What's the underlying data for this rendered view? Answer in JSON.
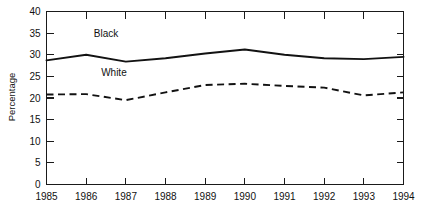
{
  "chart_data": {
    "type": "line",
    "title": "",
    "subtitle": "",
    "xlabel": "",
    "ylabel": "Percentage",
    "x": [
      1985,
      1986,
      1987,
      1988,
      1989,
      1990,
      1991,
      1992,
      1993,
      1994
    ],
    "xtick_labels": [
      "1985",
      "1986",
      "1987",
      "1988",
      "1989",
      "1990",
      "1991",
      "1992",
      "1993",
      "1994"
    ],
    "ytick_labels": [
      "0",
      "5",
      "10",
      "15",
      "20",
      "25",
      "30",
      "35",
      "40"
    ],
    "ytick_values": [
      0,
      5,
      10,
      15,
      20,
      25,
      30,
      35,
      40
    ],
    "xlim": [
      1985,
      1994
    ],
    "ylim": [
      0,
      40
    ],
    "grid": false,
    "legend_position": "inline-annotation",
    "series": [
      {
        "name": "Black",
        "style": "solid",
        "color": "#121212",
        "label_x": 1986.5,
        "label_y": 34.2,
        "values": [
          28.7,
          30.0,
          28.4,
          29.2,
          30.3,
          31.2,
          30.0,
          29.2,
          29.0,
          29.5
        ]
      },
      {
        "name": "White",
        "style": "dashed",
        "color": "#121212",
        "label_x": 1986.7,
        "label_y": 25.0,
        "values": [
          20.8,
          20.9,
          19.5,
          21.3,
          23.0,
          23.3,
          22.8,
          22.4,
          20.6,
          21.3
        ]
      }
    ]
  },
  "axes": {
    "y_axis_title": "Percentage",
    "box_frame": true,
    "top_ticks": true,
    "right_ticks": true
  }
}
